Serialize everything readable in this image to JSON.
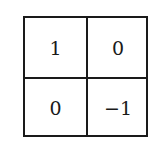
{
  "matrix": {
    "rows": [
      [
        "1",
        "0"
      ],
      [
        "0",
        "−1"
      ]
    ]
  }
}
